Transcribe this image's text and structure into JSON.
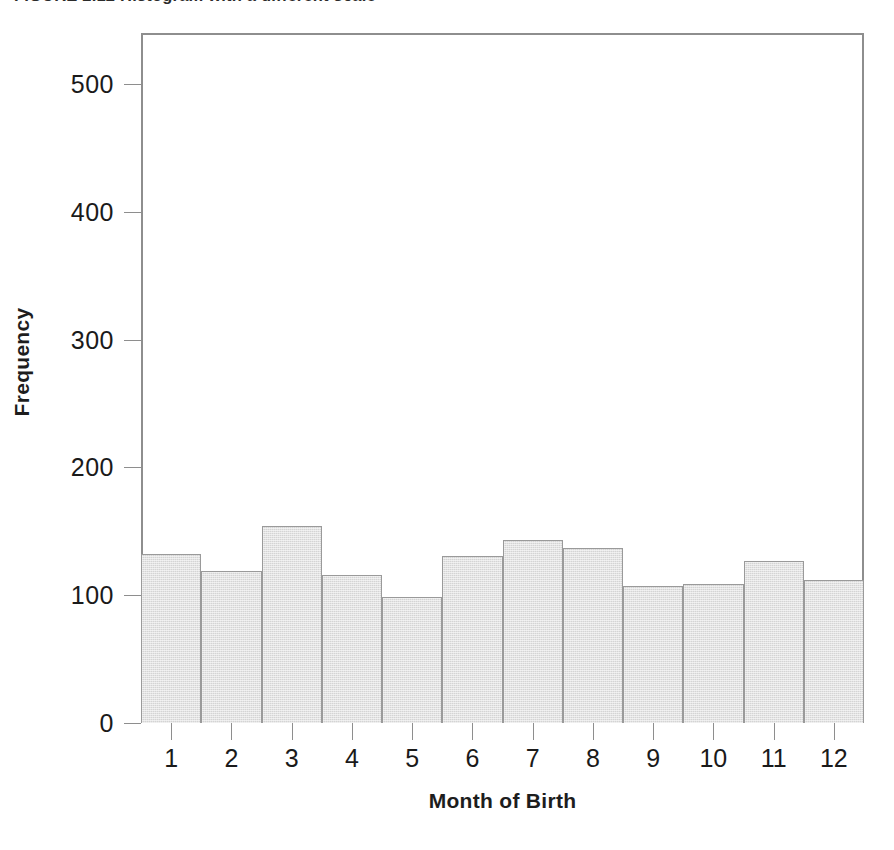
{
  "figure": {
    "caption": "FIGURE 2.12  Histogram with a different scale"
  },
  "chart_data": {
    "type": "bar",
    "title": "FIGURE 2.12  Histogram with a different scale",
    "subtitle": "",
    "xlabel": "Month of Birth",
    "ylabel": "Frequency",
    "categories": [
      "1",
      "2",
      "3",
      "4",
      "5",
      "6",
      "7",
      "8",
      "9",
      "10",
      "11",
      "12"
    ],
    "values": [
      132,
      119,
      154,
      116,
      99,
      131,
      143,
      137,
      107,
      109,
      127,
      112
    ],
    "ylim": [
      0,
      540
    ],
    "xlim": [
      0.5,
      12.5
    ],
    "yticks": [
      0,
      100,
      200,
      300,
      400,
      500
    ],
    "ytick_labels": [
      "0",
      "100",
      "200",
      "300",
      "400",
      "500"
    ],
    "xtick_labels": [
      "1",
      "2",
      "3",
      "4",
      "5",
      "6",
      "7",
      "8",
      "9",
      "10",
      "11",
      "12"
    ],
    "grid": false,
    "legend": false,
    "legend_position": "none",
    "bar_fill_color": "#d4d4d4",
    "bar_edge_color": "#9a9a9a",
    "axis_color": "#8e8e8e",
    "text_color": "#1a1a1a",
    "background_color": "#ffffff",
    "bar_gap": 0
  }
}
